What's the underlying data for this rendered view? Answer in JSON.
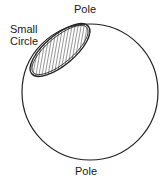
{
  "diagram": {
    "labels": {
      "top_pole": "Pole",
      "bottom_pole": "Pole",
      "small_circle_line1": "Small",
      "small_circle_line2": "Circle"
    },
    "sphere": {
      "cx": 90,
      "cy": 92,
      "r": 68,
      "stroke": "#222222"
    },
    "small_circle": {
      "cx": 60,
      "cy": 50,
      "rx": 37,
      "ry": 15,
      "rotate": -40,
      "hatch": "#333333"
    }
  }
}
